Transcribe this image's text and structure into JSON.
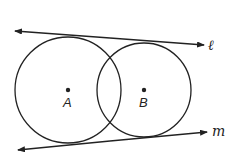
{
  "diagram": {
    "points": [
      {
        "id": "A",
        "label": "A"
      },
      {
        "id": "B",
        "label": "B"
      }
    ],
    "lines": [
      {
        "id": "l",
        "label": "ℓ"
      },
      {
        "id": "m",
        "label": "m"
      }
    ],
    "colors": {
      "stroke": "#222222",
      "background": "#ffffff"
    }
  }
}
